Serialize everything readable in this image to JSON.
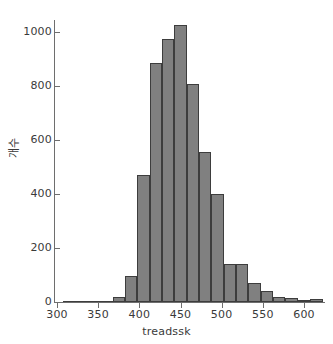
{
  "chart_data": {
    "type": "bar",
    "title": "",
    "subtitle": "",
    "xlabel": "treadssk",
    "ylabel": "개수",
    "xlim": [
      300,
      630
    ],
    "ylim": [
      0,
      1060
    ],
    "bin_width": 15,
    "grid": false,
    "legend": null,
    "annotations": [],
    "xticks": [
      300,
      350,
      400,
      450,
      500,
      550,
      600
    ],
    "xtick_labels": [
      "300",
      "350",
      "400",
      "450",
      "500",
      "550",
      "600"
    ],
    "yticks": [
      0,
      200,
      400,
      600,
      800,
      1000
    ],
    "ytick_labels": [
      "0",
      "200",
      "400",
      "600",
      "800",
      "1000"
    ],
    "bar_color": "#808080",
    "bar_edge_color": "#3d3d3d",
    "axis_color": "#6e6e6e",
    "text_color": "#3a3a3a",
    "categories": [
      "315",
      "330",
      "345",
      "360",
      "375",
      "390",
      "405",
      "420",
      "435",
      "450",
      "465",
      "480",
      "495",
      "510",
      "525",
      "540",
      "555",
      "570",
      "585",
      "600",
      "615"
    ],
    "bin_starts": [
      307.5,
      322.5,
      337.5,
      352.5,
      367.5,
      382.5,
      397.5,
      412.5,
      427.5,
      442.5,
      457.5,
      472.5,
      487.5,
      502.5,
      517.5,
      532.5,
      547.5,
      562.5,
      577.5,
      592.5,
      607.5
    ],
    "values": [
      2,
      2,
      3,
      5,
      18,
      95,
      472,
      885,
      973,
      1025,
      808,
      557,
      400,
      140,
      140,
      70,
      42,
      20,
      15,
      8,
      12
    ]
  },
  "axis": {
    "y_title": "개수",
    "x_title": "treadssk"
  }
}
